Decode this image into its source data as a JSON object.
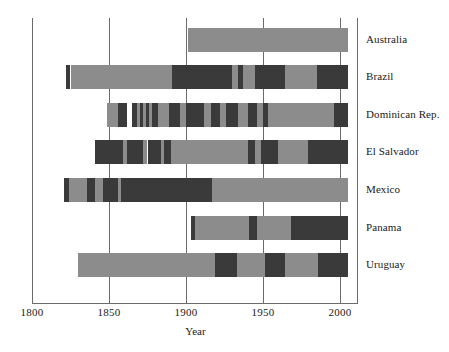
{
  "chart_data": {
    "type": "bar",
    "title": "",
    "subtitle": "",
    "xlabel": "Year",
    "ylabel": "",
    "xlim": [
      1795,
      2008
    ],
    "xticks": [
      1800,
      1850,
      1900,
      1950,
      2000
    ],
    "xticklabels": [
      "1800",
      "1850",
      "1900",
      "1950",
      "2000"
    ],
    "grid": true,
    "legend": "none",
    "orientation": "horizontal-timeline",
    "colors": {
      "light": "#8c8c8c",
      "dark": "#3a3a3a",
      "axis": "#6b6b6b",
      "text": "#1a1a1a",
      "background": "#ffffff"
    },
    "categories": [
      "Australia",
      "Brazil",
      "Dominican Rep.",
      "El Salvador",
      "Mexico",
      "Panama",
      "Uruguay"
    ],
    "series": [
      {
        "name": "Australia",
        "segments": [
          {
            "start": 1901,
            "end": 2005,
            "shade": "light"
          }
        ]
      },
      {
        "name": "Brazil",
        "segments": [
          {
            "start": 1822,
            "end": 1825,
            "shade": "dark"
          },
          {
            "start": 1825,
            "end": 1891,
            "shade": "light"
          },
          {
            "start": 1891,
            "end": 1930,
            "shade": "dark"
          },
          {
            "start": 1930,
            "end": 1934,
            "shade": "light"
          },
          {
            "start": 1934,
            "end": 1937,
            "shade": "dark"
          },
          {
            "start": 1937,
            "end": 1945,
            "shade": "light"
          },
          {
            "start": 1945,
            "end": 1964,
            "shade": "dark"
          },
          {
            "start": 1964,
            "end": 1985,
            "shade": "light"
          },
          {
            "start": 1985,
            "end": 2005,
            "shade": "dark"
          }
        ]
      },
      {
        "name": "Dominican Rep.",
        "segments": [
          {
            "start": 1849,
            "end": 1856,
            "shade": "light"
          },
          {
            "start": 1856,
            "end": 1862,
            "shade": "dark"
          },
          {
            "start": 1865,
            "end": 1868,
            "shade": "dark"
          },
          {
            "start": 1868,
            "end": 1870,
            "shade": "light"
          },
          {
            "start": 1870,
            "end": 1872,
            "shade": "dark"
          },
          {
            "start": 1872,
            "end": 1874,
            "shade": "light"
          },
          {
            "start": 1874,
            "end": 1876,
            "shade": "dark"
          },
          {
            "start": 1876,
            "end": 1878,
            "shade": "light"
          },
          {
            "start": 1878,
            "end": 1882,
            "shade": "dark"
          },
          {
            "start": 1882,
            "end": 1889,
            "shade": "light"
          },
          {
            "start": 1889,
            "end": 1896,
            "shade": "dark"
          },
          {
            "start": 1896,
            "end": 1900,
            "shade": "light"
          },
          {
            "start": 1900,
            "end": 1912,
            "shade": "dark"
          },
          {
            "start": 1912,
            "end": 1916,
            "shade": "light"
          },
          {
            "start": 1916,
            "end": 1922,
            "shade": "dark"
          },
          {
            "start": 1922,
            "end": 1926,
            "shade": "light"
          },
          {
            "start": 1926,
            "end": 1934,
            "shade": "dark"
          },
          {
            "start": 1934,
            "end": 1940,
            "shade": "light"
          },
          {
            "start": 1940,
            "end": 1946,
            "shade": "dark"
          },
          {
            "start": 1946,
            "end": 1950,
            "shade": "light"
          },
          {
            "start": 1950,
            "end": 1953,
            "shade": "dark"
          },
          {
            "start": 1953,
            "end": 1996,
            "shade": "light"
          },
          {
            "start": 1996,
            "end": 2005,
            "shade": "dark"
          }
        ]
      },
      {
        "name": "El Salvador",
        "segments": [
          {
            "start": 1841,
            "end": 1859,
            "shade": "dark"
          },
          {
            "start": 1859,
            "end": 1862,
            "shade": "light"
          },
          {
            "start": 1862,
            "end": 1872,
            "shade": "dark"
          },
          {
            "start": 1872,
            "end": 1875,
            "shade": "light"
          },
          {
            "start": 1875,
            "end": 1884,
            "shade": "dark"
          },
          {
            "start": 1884,
            "end": 1886,
            "shade": "light"
          },
          {
            "start": 1886,
            "end": 1890,
            "shade": "dark"
          },
          {
            "start": 1890,
            "end": 1940,
            "shade": "light"
          },
          {
            "start": 1940,
            "end": 1945,
            "shade": "dark"
          },
          {
            "start": 1945,
            "end": 1949,
            "shade": "light"
          },
          {
            "start": 1949,
            "end": 1960,
            "shade": "dark"
          },
          {
            "start": 1960,
            "end": 1979,
            "shade": "light"
          },
          {
            "start": 1979,
            "end": 2005,
            "shade": "dark"
          }
        ]
      },
      {
        "name": "Mexico",
        "segments": [
          {
            "start": 1821,
            "end": 1824,
            "shade": "dark"
          },
          {
            "start": 1824,
            "end": 1836,
            "shade": "light"
          },
          {
            "start": 1836,
            "end": 1841,
            "shade": "dark"
          },
          {
            "start": 1841,
            "end": 1846,
            "shade": "light"
          },
          {
            "start": 1846,
            "end": 1856,
            "shade": "dark"
          },
          {
            "start": 1856,
            "end": 1858,
            "shade": "light"
          },
          {
            "start": 1858,
            "end": 1917,
            "shade": "dark"
          },
          {
            "start": 1917,
            "end": 2005,
            "shade": "light"
          }
        ]
      },
      {
        "name": "Panama",
        "segments": [
          {
            "start": 1903,
            "end": 1906,
            "shade": "dark"
          },
          {
            "start": 1906,
            "end": 1941,
            "shade": "light"
          },
          {
            "start": 1941,
            "end": 1946,
            "shade": "dark"
          },
          {
            "start": 1946,
            "end": 1968,
            "shade": "light"
          },
          {
            "start": 1968,
            "end": 2005,
            "shade": "dark"
          }
        ]
      },
      {
        "name": "Uruguay",
        "segments": [
          {
            "start": 1830,
            "end": 1919,
            "shade": "light"
          },
          {
            "start": 1919,
            "end": 1933,
            "shade": "dark"
          },
          {
            "start": 1933,
            "end": 1951,
            "shade": "light"
          },
          {
            "start": 1951,
            "end": 1964,
            "shade": "dark"
          },
          {
            "start": 1964,
            "end": 1986,
            "shade": "light"
          },
          {
            "start": 1986,
            "end": 2005,
            "shade": "dark"
          }
        ]
      }
    ]
  }
}
